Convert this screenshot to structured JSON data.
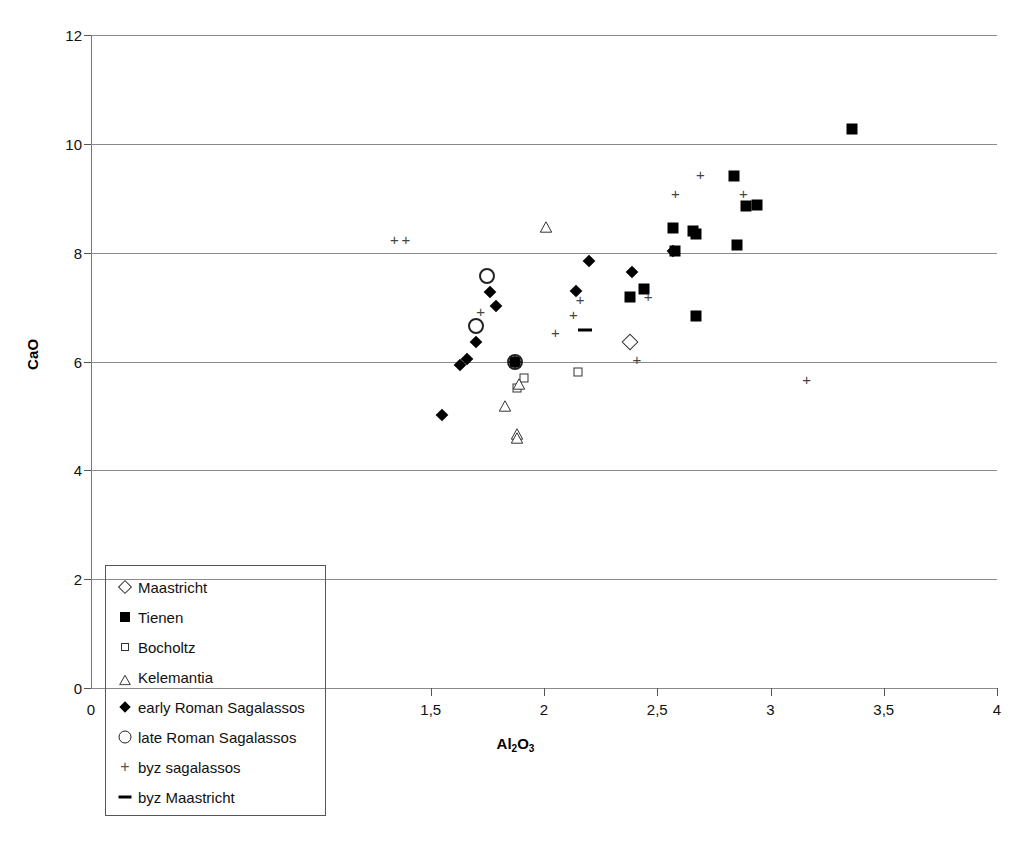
{
  "chart_data": {
    "type": "scatter",
    "title": "",
    "xlabel": "Al2O3",
    "xlabel_rich": "Al₂O₃",
    "ylabel": "CaO",
    "xlim": [
      0,
      4
    ],
    "ylim": [
      0,
      12
    ],
    "grid": "horizontal",
    "decimal_separator": ",",
    "x_ticks": [
      {
        "value": 0,
        "label": "0"
      },
      {
        "value": 1.5,
        "label": "1,5"
      },
      {
        "value": 2,
        "label": "2"
      },
      {
        "value": 2.5,
        "label": "2,5"
      },
      {
        "value": 3,
        "label": "3"
      },
      {
        "value": 3.5,
        "label": "3,5"
      },
      {
        "value": 4,
        "label": "4"
      }
    ],
    "y_ticks": [
      {
        "value": 0,
        "label": "0"
      },
      {
        "value": 2,
        "label": "2"
      },
      {
        "value": 4,
        "label": "4"
      },
      {
        "value": 6,
        "label": "6"
      },
      {
        "value": 8,
        "label": "8"
      },
      {
        "value": 10,
        "label": "10"
      },
      {
        "value": 12,
        "label": "12"
      }
    ],
    "legend_position": "bottom-left-inside",
    "series": [
      {
        "name": "Maastricht",
        "marker": "open-diamond",
        "points": [
          [
            2.38,
            6.35
          ]
        ]
      },
      {
        "name": "Tienen",
        "marker": "filled-square",
        "points": [
          [
            3.36,
            10.27
          ],
          [
            2.84,
            9.4
          ],
          [
            2.89,
            8.85
          ],
          [
            2.94,
            8.87
          ],
          [
            2.57,
            8.45
          ],
          [
            2.66,
            8.4
          ],
          [
            2.67,
            8.35
          ],
          [
            2.85,
            8.15
          ],
          [
            2.58,
            8.03
          ],
          [
            2.67,
            6.83
          ],
          [
            2.44,
            7.33
          ],
          [
            2.38,
            7.18
          ],
          [
            1.87,
            6.0
          ]
        ]
      },
      {
        "name": "Bocholtz",
        "marker": "open-square",
        "points": [
          [
            1.91,
            5.7
          ],
          [
            1.88,
            5.52
          ],
          [
            2.15,
            5.8
          ]
        ]
      },
      {
        "name": "Kelemantia",
        "marker": "open-triangle",
        "points": [
          [
            2.01,
            8.5
          ],
          [
            1.89,
            5.62
          ],
          [
            1.83,
            5.22
          ],
          [
            1.88,
            4.7
          ],
          [
            1.88,
            4.63
          ]
        ]
      },
      {
        "name": "early Roman Sagalassos",
        "marker": "filled-diamond",
        "points": [
          [
            2.57,
            8.03
          ],
          [
            2.2,
            7.85
          ],
          [
            2.39,
            7.65
          ],
          [
            2.14,
            7.3
          ],
          [
            1.76,
            7.28
          ],
          [
            1.79,
            7.02
          ],
          [
            1.7,
            6.35
          ],
          [
            1.66,
            6.05
          ],
          [
            1.63,
            5.94
          ],
          [
            1.87,
            6.0
          ],
          [
            1.55,
            5.01
          ]
        ]
      },
      {
        "name": "late Roman Sagalassos",
        "marker": "open-circle",
        "points": [
          [
            1.75,
            7.58
          ],
          [
            1.7,
            6.65
          ],
          [
            1.87,
            6.0
          ]
        ]
      },
      {
        "name": "byz sagalassos",
        "marker": "plus",
        "points": [
          [
            1.34,
            8.25
          ],
          [
            1.39,
            8.25
          ],
          [
            2.58,
            9.1
          ],
          [
            2.69,
            9.45
          ],
          [
            2.88,
            9.1
          ],
          [
            2.46,
            7.2
          ],
          [
            2.16,
            7.15
          ],
          [
            2.13,
            6.88
          ],
          [
            1.72,
            6.93
          ],
          [
            2.05,
            6.55
          ],
          [
            2.41,
            6.05
          ],
          [
            3.16,
            5.68
          ]
        ]
      },
      {
        "name": "byz Maastricht",
        "marker": "dash",
        "points": [
          [
            2.18,
            6.57
          ]
        ]
      }
    ]
  },
  "legend": {
    "items": [
      {
        "label": "Maastricht",
        "marker": "open-diamond"
      },
      {
        "label": "Tienen",
        "marker": "filled-square"
      },
      {
        "label": "Bocholtz",
        "marker": "open-square"
      },
      {
        "label": "Kelemantia",
        "marker": "open-triangle"
      },
      {
        "label": "early Roman Sagalassos",
        "marker": "filled-diamond"
      },
      {
        "label": "late Roman Sagalassos",
        "marker": "open-circle"
      },
      {
        "label": "byz sagalassos",
        "marker": "plus"
      },
      {
        "label": "byz Maastricht",
        "marker": "dash"
      }
    ]
  },
  "colors": {
    "marker": "#000000",
    "grid": "#8a8a8a",
    "axis": "#555555",
    "background": "#ffffff"
  }
}
